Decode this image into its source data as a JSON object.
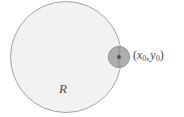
{
  "figure": {
    "width": 184,
    "height": 117,
    "background_color": "#ffffff",
    "region": {
      "name": "region-disk",
      "label": "R",
      "center_x": 66,
      "center_y": 57,
      "radius": 56,
      "fill_color": "#f2f2f2",
      "stroke_color": "#999999",
      "stroke_width": 0.9
    },
    "point": {
      "name": "boundary-point",
      "label_open_paren": "(",
      "label_x_symbol": "x",
      "label_x_subscript": "0",
      "label_comma": ",",
      "label_y_symbol": "y",
      "label_y_subscript": "0",
      "label_close_paren": ")",
      "center_x": 119,
      "center_y": 57,
      "radius": 11,
      "fill_color": "#a8a8a8",
      "stroke_color": "#8a8a8a",
      "dot_color": "#4d4d4d",
      "dot_radius": 1.8
    },
    "text_color": "#4d4d4d"
  }
}
